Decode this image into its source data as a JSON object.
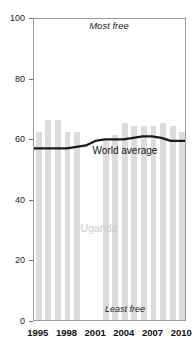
{
  "chart_data": {
    "type": "bar",
    "title": "",
    "subtitle": "",
    "xlabel": "",
    "ylabel": "",
    "ylim": [
      0,
      100
    ],
    "xlim": [
      1994.5,
      2010.5
    ],
    "grid": false,
    "legend_position": "inline-annotations",
    "categories": [
      1995,
      1996,
      1997,
      1998,
      1999,
      2000,
      2001,
      2002,
      2003,
      2004,
      2005,
      2006,
      2007,
      2008,
      2009,
      2010
    ],
    "series": [
      {
        "name": "Uganda",
        "type": "bar",
        "color": "#dcdcdc",
        "values": [
          62,
          66,
          66,
          62,
          62,
          0,
          0,
          59,
          61,
          65,
          64,
          64,
          64,
          65,
          64,
          62
        ]
      },
      {
        "name": "World average",
        "type": "line",
        "color": "#1a1a1a",
        "values": [
          57,
          57,
          57,
          57,
          57.5,
          58,
          59.5,
          60,
          60,
          60,
          60.5,
          61,
          61,
          60.5,
          59.5,
          59.5
        ]
      }
    ],
    "yticks": [
      0,
      20,
      40,
      60,
      80,
      100
    ],
    "ytick_labels": [
      "0",
      "20",
      "40",
      "60",
      "80",
      "100"
    ],
    "xticks": [
      1995,
      1998,
      2001,
      2004,
      2007,
      2010
    ],
    "xtick_labels": [
      "1995",
      "1998",
      "2001",
      "2004",
      "2007",
      "2010"
    ],
    "annotations": {
      "most_free": "Most free",
      "least_free": "Least free",
      "uganda": "Uganda",
      "world_average": "World average"
    },
    "colors": {
      "bar": "#dcdcdc",
      "line": "#1a1a1a",
      "frame": "#9a9a9a",
      "uganda_label": "#c9c9c9",
      "text": "#1a1a1a"
    }
  }
}
